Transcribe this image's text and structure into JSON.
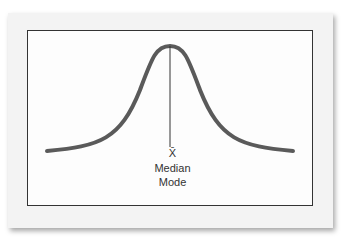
{
  "diagram": {
    "labels": {
      "mean": "X̄",
      "median": "Median",
      "mode": "Mode"
    },
    "colors": {
      "curve": "#5a5a5a",
      "line": "#333333",
      "frame": "#333333",
      "card": "#f3f3f3"
    }
  }
}
